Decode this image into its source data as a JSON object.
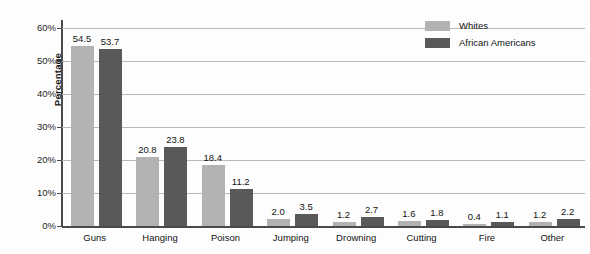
{
  "chart_data": {
    "type": "bar",
    "title": "",
    "subtitle": "",
    "xlabel": "",
    "ylabel": "Percentage",
    "ylim": [
      0,
      60
    ],
    "ytick_labels": [
      "0%",
      "10%",
      "20%",
      "30%",
      "40%",
      "50%",
      "60%"
    ],
    "ytick_values": [
      0,
      10,
      20,
      30,
      40,
      50,
      60
    ],
    "grid": true,
    "legend_position": "top-right",
    "categories": [
      "Guns",
      "Hanging",
      "Poison",
      "Jumping",
      "Drowning",
      "Cutting",
      "Fire",
      "Other"
    ],
    "series": [
      {
        "name": "Whites",
        "color": "#b2b2b2",
        "values": [
          54.5,
          20.8,
          18.4,
          2.0,
          1.2,
          1.6,
          0.4,
          1.2
        ],
        "labels": [
          "54.5",
          "20.8",
          "18.4",
          "2.0",
          "1.2",
          "1.6",
          "0.4",
          "1.2"
        ]
      },
      {
        "name": "African Americans",
        "color": "#595959",
        "values": [
          53.7,
          23.8,
          11.2,
          3.5,
          2.7,
          1.8,
          1.1,
          2.2
        ],
        "labels": [
          "53.7",
          "23.8",
          "11.2",
          "3.5",
          "2.7",
          "1.8",
          "1.1",
          "2.2"
        ]
      }
    ]
  },
  "legend": {
    "items": [
      {
        "label": "Whites",
        "color": "#b2b2b2"
      },
      {
        "label": "African Americans",
        "color": "#595959"
      }
    ]
  },
  "axis": {
    "y_title": "Percentage"
  }
}
